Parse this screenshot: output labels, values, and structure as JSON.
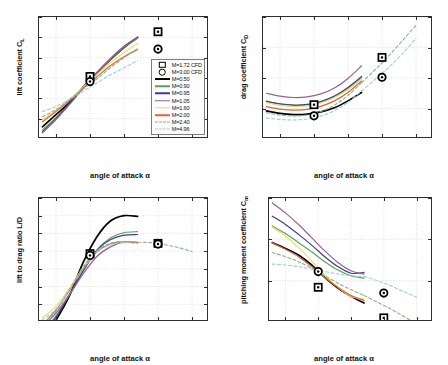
{
  "figure": {
    "title": "",
    "xlabel": "angle of attack α"
  },
  "legend": {
    "position": "inside lift panel, lower right",
    "entries": [
      {
        "label": "M=1.72 CFD",
        "style": "marker-square",
        "color": "#000000"
      },
      {
        "label": "M=3.00 CFD",
        "style": "marker-circle",
        "color": "#000000"
      },
      {
        "label": "M=0.50",
        "style": "solid",
        "color": "#000000"
      },
      {
        "label": "M=0.90",
        "style": "solid",
        "color": "#5aa05a"
      },
      {
        "label": "M=0.95",
        "style": "solid",
        "color": "#3b3f8f"
      },
      {
        "label": "M=1.05",
        "style": "solid",
        "color": "#9b5f8f"
      },
      {
        "label": "M=1.60",
        "style": "solid",
        "color": "#e8e06a"
      },
      {
        "label": "M=2.00",
        "style": "solid",
        "color": "#e4603a"
      },
      {
        "label": "M=2.40",
        "style": "dashed",
        "color": "#7fb77f"
      },
      {
        "label": "M=4.96",
        "style": "dashed",
        "color": "#9ccfd4"
      }
    ]
  },
  "chart_data": [
    {
      "id": "lift",
      "type": "line",
      "title": "",
      "xlabel": "angle of attack α",
      "ylabel": "lift coefficient C",
      "ylabel_sub": "L",
      "xlim": [
        -5,
        45
      ],
      "ylim": [
        -0.4,
        0.8
      ],
      "xticks": [
        0,
        10,
        20,
        30,
        40
      ],
      "yticks": [
        -0.4,
        -0.2,
        0,
        0.2,
        0.4,
        0.6,
        0.8
      ],
      "ytick_labels": [
        "-0.4",
        "-0.2",
        "0",
        "0.2",
        "0.4",
        "0.6",
        "0.8"
      ],
      "grid": true,
      "x": [
        -4,
        0,
        4,
        8,
        12,
        16,
        20,
        24
      ],
      "series": [
        {
          "name": "M=0.50",
          "color": "#000000",
          "dash": false,
          "values": [
            -0.28,
            -0.16,
            -0.04,
            0.11,
            0.25,
            0.38,
            0.5,
            0.6
          ]
        },
        {
          "name": "M=0.90",
          "color": "#5aa05a",
          "dash": false,
          "values": [
            -0.31,
            -0.19,
            -0.05,
            0.1,
            0.25,
            0.38,
            0.5,
            0.59
          ]
        },
        {
          "name": "M=0.95",
          "color": "#3b3f8f",
          "dash": false,
          "values": [
            -0.33,
            -0.2,
            -0.05,
            0.1,
            0.25,
            0.39,
            0.51,
            0.6
          ]
        },
        {
          "name": "M=1.05",
          "color": "#9b5f8f",
          "dash": false,
          "values": [
            -0.34,
            -0.21,
            -0.06,
            0.1,
            0.25,
            0.39,
            0.51,
            0.6
          ]
        },
        {
          "name": "M=1.60",
          "color": "#e8e06a",
          "dash": false,
          "values": [
            -0.21,
            -0.12,
            -0.01,
            0.11,
            0.23,
            0.35,
            0.45,
            0.54
          ]
        },
        {
          "name": "M=2.00",
          "color": "#e4603a",
          "dash": false,
          "values": [
            -0.23,
            -0.13,
            -0.02,
            0.1,
            0.21,
            0.32,
            0.41,
            0.48
          ]
        },
        {
          "name": "M=2.40",
          "color": "#7fb77f",
          "dash": true,
          "values": [
            -0.18,
            -0.11,
            -0.01,
            0.09,
            0.19,
            0.3,
            0.4,
            0.49
          ]
        },
        {
          "name": "M=4.96",
          "color": "#9ccfd4",
          "dash": true,
          "values": [
            -0.13,
            -0.08,
            -0.01,
            0.07,
            0.15,
            0.23,
            0.3,
            0.37
          ]
        }
      ],
      "cfd_points": [
        {
          "name": "M=1.72 CFD",
          "marker": "square",
          "x": 10,
          "y": 0.215
        },
        {
          "name": "M=1.72 CFD",
          "marker": "square",
          "x": 30,
          "y": 0.655
        },
        {
          "name": "M=3.00 CFD",
          "marker": "circle",
          "x": 10,
          "y": 0.165
        },
        {
          "name": "M=3.00 CFD",
          "marker": "circle",
          "x": 30,
          "y": 0.485
        }
      ]
    },
    {
      "id": "drag",
      "type": "line",
      "title": "",
      "xlabel": "angle of attack α",
      "ylabel": "drag coefficient C",
      "ylabel_sub": "D",
      "xlim": [
        -5,
        45
      ],
      "ylim": [
        0,
        0.8
      ],
      "xticks": [
        0,
        10,
        20,
        30,
        40
      ],
      "yticks": [
        0,
        0.2,
        0.4,
        0.6,
        0.8
      ],
      "ytick_labels": [
        "0",
        "0.2",
        "0.4",
        "0.6",
        "0.8"
      ],
      "grid": true,
      "x": [
        -4,
        0,
        4,
        8,
        12,
        16,
        20,
        24
      ],
      "series": [
        {
          "name": "M=0.50",
          "color": "#000000",
          "dash": false,
          "values": [
            0.185,
            0.168,
            0.16,
            0.163,
            0.178,
            0.205,
            0.25,
            0.305
          ]
        },
        {
          "name": "M=0.90",
          "color": "#5aa05a",
          "dash": false,
          "values": [
            0.245,
            0.228,
            0.22,
            0.224,
            0.243,
            0.277,
            0.33,
            0.4
          ]
        },
        {
          "name": "M=0.95",
          "color": "#3b3f8f",
          "dash": false,
          "values": [
            0.248,
            0.231,
            0.223,
            0.227,
            0.246,
            0.282,
            0.338,
            0.41
          ]
        },
        {
          "name": "M=1.05",
          "color": "#9b5f8f",
          "dash": false,
          "values": [
            0.3,
            0.281,
            0.272,
            0.276,
            0.296,
            0.334,
            0.397,
            0.48
          ]
        },
        {
          "name": "M=1.60",
          "color": "#e8e06a",
          "dash": false,
          "values": [
            0.238,
            0.22,
            0.212,
            0.217,
            0.236,
            0.272,
            0.325,
            0.395
          ]
        },
        {
          "name": "M=2.00",
          "color": "#e4603a",
          "dash": false,
          "values": [
            0.212,
            0.196,
            0.189,
            0.194,
            0.214,
            0.25,
            0.305,
            0.38
          ]
        },
        {
          "name": "M=2.40",
          "color": "#7fb77f",
          "dash": true,
          "values": [
            0.172,
            0.157,
            0.151,
            0.158,
            0.18,
            0.222,
            0.285,
            0.37
          ]
        },
        {
          "name": "M=4.96",
          "color": "#9ccfd4",
          "dash": true,
          "values": [
            0.138,
            0.128,
            0.125,
            0.131,
            0.15,
            0.186,
            0.24,
            0.315
          ]
        }
      ],
      "cfd_points": [
        {
          "name": "M=1.72 CFD",
          "marker": "square",
          "x": 10,
          "y": 0.225
        },
        {
          "name": "M=1.72 CFD",
          "marker": "square",
          "x": 30,
          "y": 0.535
        },
        {
          "name": "M=3.00 CFD",
          "marker": "circle",
          "x": 10,
          "y": 0.152
        },
        {
          "name": "M=3.00 CFD",
          "marker": "circle",
          "x": 30,
          "y": 0.405
        }
      ],
      "extrapolated": [
        {
          "name": "M=2.40",
          "color": "#7fb77f",
          "x": [
            24,
            28,
            32,
            36,
            40
          ],
          "values": [
            0.37,
            0.455,
            0.545,
            0.645,
            0.745
          ]
        },
        {
          "name": "M=4.96",
          "color": "#9ccfd4",
          "x": [
            24,
            28,
            32,
            36,
            40
          ],
          "values": [
            0.315,
            0.39,
            0.47,
            0.56,
            0.66
          ]
        }
      ]
    },
    {
      "id": "lift_to_drag",
      "type": "line",
      "title": "",
      "xlabel": "angle of attack α",
      "ylabel": "lift to drag ratio L/D",
      "ylabel_sub": "",
      "xlim": [
        -5,
        45
      ],
      "ylim": [
        -1,
        2.5
      ],
      "xticks": [
        0,
        10,
        20,
        30,
        40
      ],
      "yticks": [
        -1,
        -0.5,
        0,
        0.5,
        1,
        1.5,
        2,
        2.5
      ],
      "ytick_labels": [
        "-1",
        "-0.5",
        "0",
        "0.5",
        "1",
        "1.5",
        "2",
        "2.5"
      ],
      "grid": true,
      "x": [
        -4,
        0,
        4,
        8,
        12,
        16,
        20,
        24
      ],
      "series": [
        {
          "name": "M=0.50",
          "color": "#000000",
          "dash": false,
          "values": [
            -1.52,
            -0.95,
            -0.25,
            0.68,
            1.4,
            1.85,
            2.0,
            1.98
          ]
        },
        {
          "name": "M=0.90",
          "color": "#5aa05a",
          "dash": false,
          "values": [
            -1.27,
            -0.83,
            -0.23,
            0.45,
            1.03,
            1.37,
            1.52,
            1.55
          ]
        },
        {
          "name": "M=0.95",
          "color": "#3b3f8f",
          "dash": false,
          "values": [
            -1.33,
            -0.87,
            -0.22,
            0.44,
            1.02,
            1.32,
            1.45,
            1.47
          ]
        },
        {
          "name": "M=1.05",
          "color": "#9b5f8f",
          "dash": false,
          "values": [
            -1.13,
            -0.75,
            -0.22,
            0.36,
            0.85,
            1.12,
            1.26,
            1.25
          ]
        },
        {
          "name": "M=1.60",
          "color": "#e8e06a",
          "dash": false,
          "values": [
            -0.88,
            -0.55,
            -0.05,
            0.51,
            0.97,
            1.21,
            1.27,
            1.24
          ]
        },
        {
          "name": "M=2.00",
          "color": "#e4603a",
          "dash": false,
          "values": [
            -1.08,
            -0.66,
            -0.11,
            0.52,
            0.98,
            1.2,
            1.26,
            1.24
          ]
        },
        {
          "name": "M=2.40",
          "color": "#7fb77f",
          "dash": true,
          "values": [
            -1.05,
            -0.7,
            -0.07,
            0.57,
            1.01,
            1.22,
            1.27,
            1.25
          ]
        },
        {
          "name": "M=4.96",
          "color": "#9ccfd4",
          "dash": true,
          "values": [
            -0.94,
            -0.63,
            -0.08,
            0.53,
            0.97,
            1.18,
            1.24,
            1.21
          ]
        }
      ],
      "cfd_points": [
        {
          "name": "M=1.72 CFD",
          "marker": "square",
          "x": 10,
          "y": 0.93
        },
        {
          "name": "M=1.72 CFD",
          "marker": "square",
          "x": 30,
          "y": 1.22
        },
        {
          "name": "M=3.00 CFD",
          "marker": "circle",
          "x": 10,
          "y": 0.88
        },
        {
          "name": "M=3.00 CFD",
          "marker": "circle",
          "x": 30,
          "y": 1.2
        }
      ],
      "extrapolated": [
        {
          "name": "M=2.40",
          "color": "#7fb77f",
          "x": [
            24,
            28,
            32,
            36,
            40
          ],
          "values": [
            1.25,
            1.24,
            1.18,
            1.1,
            0.99
          ]
        }
      ]
    },
    {
      "id": "pitching_moment",
      "type": "line",
      "title": "",
      "xlabel": "angle of attack α",
      "ylabel": "pitching moment coefficient C",
      "ylabel_sub": "m",
      "xlim": [
        -5,
        45
      ],
      "ylim": [
        -0.05,
        0.1
      ],
      "xticks": [
        0,
        10,
        20,
        30,
        40
      ],
      "yticks": [
        -0.05,
        0,
        0.05,
        0.1
      ],
      "ytick_labels": [
        "-0.05",
        "0",
        "0.05",
        "0.1"
      ],
      "grid": true,
      "x": [
        -4,
        0,
        4,
        8,
        12,
        16,
        20,
        24
      ],
      "series": [
        {
          "name": "M=0.50",
          "color": "#000000",
          "dash": false,
          "values": [
            0.046,
            0.039,
            0.031,
            0.019,
            0.004,
            -0.009,
            -0.019,
            -0.027
          ]
        },
        {
          "name": "M=0.90",
          "color": "#5aa05a",
          "dash": false,
          "values": [
            0.066,
            0.057,
            0.046,
            0.035,
            0.023,
            0.013,
            0.006,
            0.003
          ]
        },
        {
          "name": "M=0.95",
          "color": "#3b3f8f",
          "dash": false,
          "values": [
            0.078,
            0.068,
            0.056,
            0.043,
            0.029,
            0.017,
            0.009,
            0.01
          ]
        },
        {
          "name": "M=1.05",
          "color": "#9b5f8f",
          "dash": false,
          "values": [
            0.094,
            0.082,
            0.068,
            0.052,
            0.036,
            0.022,
            0.012,
            0.008
          ]
        },
        {
          "name": "M=1.60",
          "color": "#e8e06a",
          "dash": false,
          "values": [
            0.065,
            0.054,
            0.04,
            0.024,
            0.007,
            -0.008,
            -0.019,
            -0.022
          ]
        },
        {
          "name": "M=2.00",
          "color": "#e4603a",
          "dash": false,
          "values": [
            0.046,
            0.038,
            0.029,
            0.017,
            0.004,
            -0.008,
            -0.018,
            -0.024
          ]
        },
        {
          "name": "M=2.40",
          "color": "#7fb77f",
          "dash": true,
          "values": [
            0.034,
            0.029,
            0.023,
            0.015,
            0.006,
            -0.003,
            -0.011,
            -0.018
          ]
        },
        {
          "name": "M=4.96",
          "color": "#9ccfd4",
          "dash": true,
          "values": [
            0.02,
            0.019,
            0.017,
            0.014,
            0.011,
            0.008,
            0.006,
            0.005
          ]
        }
      ],
      "cfd_points": [
        {
          "name": "M=1.72 CFD",
          "marker": "square",
          "x": 10,
          "y": -0.008
        },
        {
          "name": "M=1.72 CFD",
          "marker": "square",
          "x": 30,
          "y": -0.045
        },
        {
          "name": "M=3.00 CFD",
          "marker": "circle",
          "x": 10,
          "y": 0.011
        },
        {
          "name": "M=3.00 CFD",
          "marker": "circle",
          "x": 30,
          "y": -0.015
        }
      ],
      "extrapolated": [
        {
          "name": "M=2.40",
          "color": "#7fb77f",
          "x": [
            24,
            28,
            32,
            36,
            40
          ],
          "values": [
            -0.018,
            -0.026,
            -0.034,
            -0.043,
            -0.052
          ]
        },
        {
          "name": "M=4.96",
          "color": "#9ccfd4",
          "x": [
            24,
            28,
            32,
            36,
            40
          ],
          "values": [
            0.005,
            0.0,
            -0.006,
            -0.013,
            -0.02
          ]
        }
      ]
    }
  ]
}
